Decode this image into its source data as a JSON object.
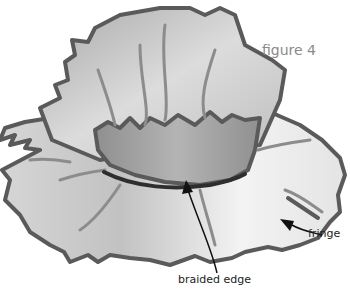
{
  "figure": {
    "title": "figure 4"
  },
  "labels": {
    "braided_edge": "braided edge",
    "fringe": "fringe"
  },
  "colors": {
    "outline": "#5a5a5a",
    "vein": "#8c8c8c",
    "braid": "#2e2e2e",
    "petal_dark": "#9a9a9a",
    "petal_light": "#f2f2f2",
    "title": "#8a8a8a"
  }
}
